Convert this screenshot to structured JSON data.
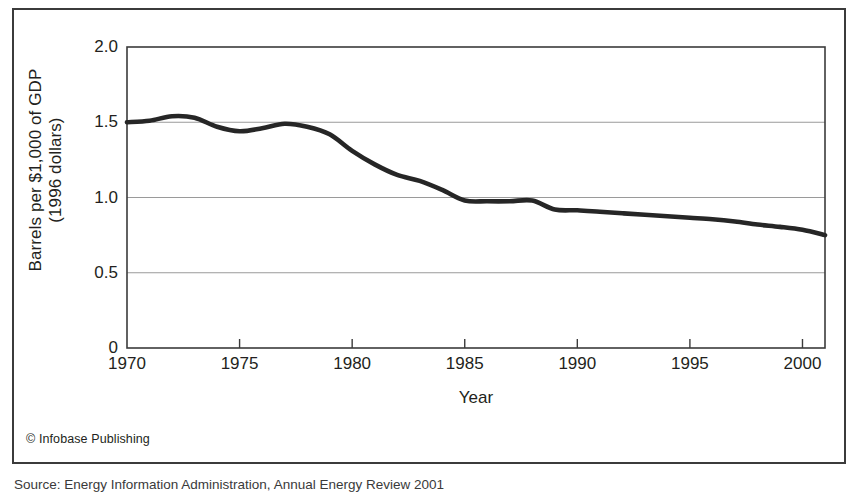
{
  "figure": {
    "credit": "© Infobase Publishing",
    "source_caption": "Source: Energy Information Administration, Annual Energy Review 2001"
  },
  "chart_data": {
    "type": "line",
    "title": "",
    "xlabel": "Year",
    "ylabel": "Barrels per $1,000 of GDP",
    "ylabel_line2": "(1996 dollars)",
    "xlim": [
      1970,
      2001
    ],
    "ylim": [
      0,
      2.0
    ],
    "xticks": [
      1970,
      1975,
      1980,
      1985,
      1990,
      1995,
      2000
    ],
    "xtick_labels": [
      "1970",
      "1975",
      "1980",
      "1985",
      "1990",
      "1995",
      "2000"
    ],
    "yticks": [
      0,
      0.5,
      1.0,
      1.5,
      2.0
    ],
    "ytick_labels": [
      "0",
      "0.5",
      "1.0",
      "1.5",
      "2.0"
    ],
    "grid": "horizontal",
    "legend": "none",
    "line_color": "#262626",
    "grid_color": "#9a9a9a",
    "axis_color": "#3b3b3b",
    "series": [
      {
        "name": "Energy intensity",
        "x": [
          1970,
          1971,
          1972,
          1973,
          1974,
          1975,
          1976,
          1977,
          1978,
          1979,
          1980,
          1981,
          1982,
          1983,
          1984,
          1985,
          1986,
          1987,
          1988,
          1989,
          1990,
          1991,
          1992,
          1993,
          1994,
          1995,
          1996,
          1997,
          1998,
          1999,
          2000,
          2001
        ],
        "values": [
          1.5,
          1.51,
          1.54,
          1.53,
          1.47,
          1.44,
          1.46,
          1.49,
          1.47,
          1.42,
          1.31,
          1.22,
          1.15,
          1.11,
          1.05,
          0.98,
          0.975,
          0.975,
          0.98,
          0.92,
          0.915,
          0.905,
          0.895,
          0.885,
          0.875,
          0.865,
          0.855,
          0.84,
          0.82,
          0.805,
          0.785,
          0.75
        ]
      }
    ]
  }
}
